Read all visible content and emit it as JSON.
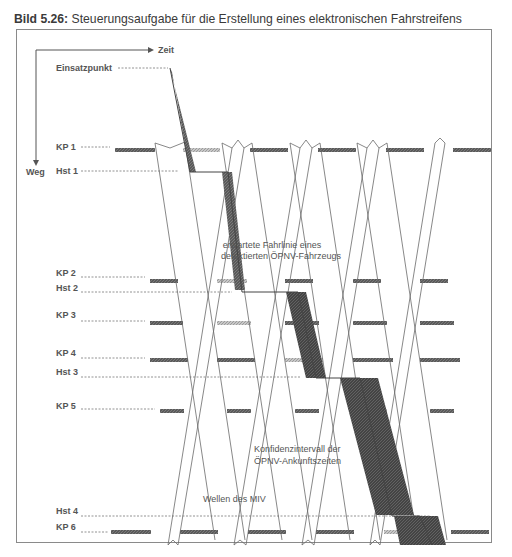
{
  "caption": {
    "prefix": "Bild 5.26:",
    "text": " Steuerungsaufgabe für die Erstellung eines elektronischen Fahrstreifens"
  },
  "axes": {
    "time_label": "Zeit",
    "distance_label": "Weg"
  },
  "labels": {
    "start": "Einsatzpunkt",
    "kp1": "KP 1",
    "hst1": "Hst 1",
    "kp2": "KP 2",
    "hst2": "Hst 2",
    "kp3": "KP 3",
    "kp4": "KP 4",
    "hst3": "Hst 3",
    "kp5": "KP 5",
    "hst4": "Hst 4",
    "kp6": "KP 6"
  },
  "annotations": {
    "trajectory_line1": "erwartete Fahrlinie eines",
    "trajectory_line2": "detektierten ÖPNV-Fahrzeugs",
    "confidence_line1": "Konfidenzintervall der",
    "confidence_line2": "ÖPNV-Ankunftszeiten",
    "waves": "Wellen des MIV"
  },
  "colors": {
    "signal_red": "#6e6e6e",
    "signal_green": "#b4b4b4",
    "confidence": "#4a4a4a",
    "line": "#666666"
  }
}
